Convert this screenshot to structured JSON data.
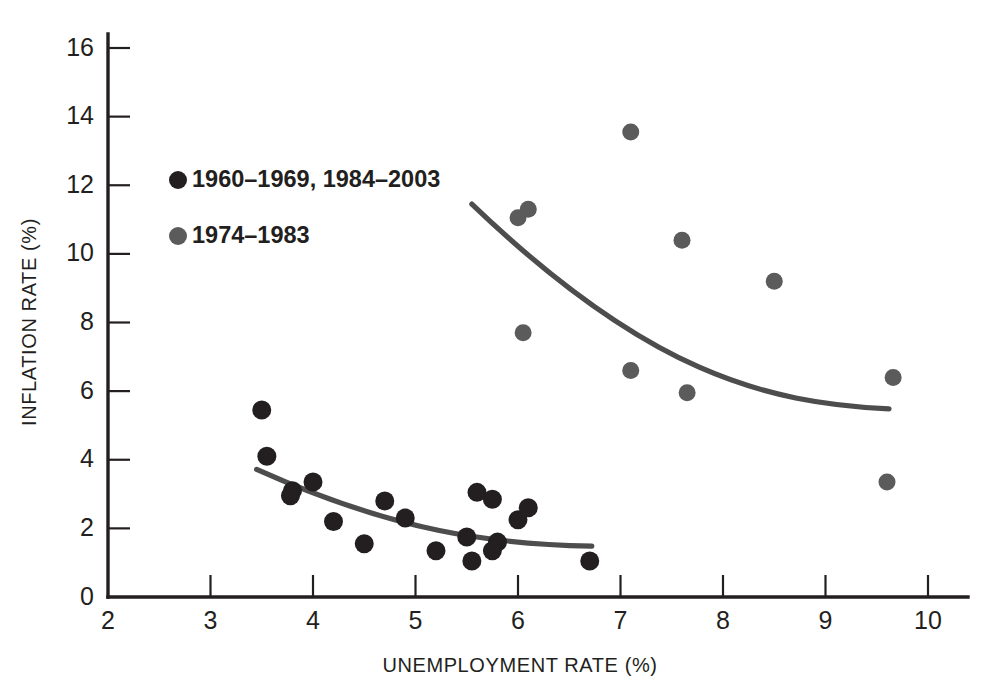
{
  "chart_data": {
    "type": "scatter",
    "title": "",
    "xlabel": "UNEMPLOYMENT RATE (%)",
    "ylabel": "INFLATION RATE (%)",
    "xlim": [
      2,
      10
    ],
    "ylim": [
      0,
      16
    ],
    "xticks": [
      2,
      3,
      4,
      5,
      6,
      7,
      8,
      9,
      10
    ],
    "yticks": [
      0,
      2,
      4,
      6,
      8,
      10,
      12,
      14,
      16
    ],
    "grid": false,
    "legend_position": "upper-left-inside",
    "series": [
      {
        "name": "1960-1969, 1984-2003",
        "color": "#231f20",
        "marker": "circle",
        "points": [
          [
            3.5,
            5.45
          ],
          [
            3.55,
            4.1
          ],
          [
            3.78,
            2.95
          ],
          [
            3.8,
            3.1
          ],
          [
            4.0,
            3.35
          ],
          [
            4.2,
            2.2
          ],
          [
            4.5,
            1.55
          ],
          [
            4.7,
            2.8
          ],
          [
            4.9,
            2.3
          ],
          [
            5.2,
            1.35
          ],
          [
            5.5,
            1.75
          ],
          [
            5.55,
            1.05
          ],
          [
            5.6,
            3.05
          ],
          [
            5.75,
            2.85
          ],
          [
            5.8,
            1.6
          ],
          [
            5.75,
            1.35
          ],
          [
            6.0,
            2.25
          ],
          [
            6.1,
            2.6
          ],
          [
            6.7,
            1.05
          ]
        ],
        "trendline": {
          "type": "curve",
          "from": [
            3.45,
            3.72
          ],
          "to": [
            6.72,
            1.48
          ],
          "description": "downward-sloping convex Phillips curve through low-inflation cluster"
        }
      },
      {
        "name": "1974-1983",
        "color": "#5b5b5b",
        "marker": "circle",
        "points": [
          [
            6.0,
            11.05
          ],
          [
            6.1,
            11.3
          ],
          [
            6.05,
            7.7
          ],
          [
            7.1,
            13.55
          ],
          [
            7.1,
            6.6
          ],
          [
            7.6,
            10.4
          ],
          [
            7.65,
            5.95
          ],
          [
            8.5,
            9.2
          ],
          [
            9.66,
            6.4
          ],
          [
            9.6,
            3.35
          ]
        ],
        "trendline": {
          "type": "curve",
          "from": [
            5.55,
            11.45
          ],
          "to": [
            9.62,
            5.48
          ],
          "description": "downward-sloping convex curve through high-inflation cluster"
        }
      }
    ]
  },
  "legend": {
    "entries": [
      {
        "marker_color": "#231f20",
        "label": "1960–1969, 1984–2003"
      },
      {
        "marker_color": "#5b5b5b",
        "label": "1974–1983"
      }
    ]
  },
  "axis_labels": {
    "x": "UNEMPLOYMENT RATE (%)",
    "y": "INFLATION RATE (%)"
  },
  "tick_text": {
    "x": [
      "2",
      "3",
      "4",
      "5",
      "6",
      "7",
      "8",
      "9",
      "10"
    ],
    "y": [
      "0",
      "2",
      "4",
      "6",
      "8",
      "10",
      "12",
      "14",
      "16"
    ]
  },
  "colors": {
    "dark_series": "#231f20",
    "gray_series": "#5b5b5b",
    "axis": "#231f20",
    "background": "#ffffff"
  }
}
